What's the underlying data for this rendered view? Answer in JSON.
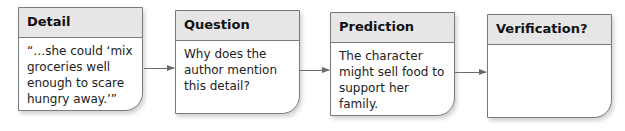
{
  "diagram": {
    "boxes": [
      {
        "title": "Detail",
        "body": "“…she could ‘mix\ngroceries well\nenough to scare\nhungry away.’”"
      },
      {
        "title": "Question",
        "body": "Why does the\nauthor mention\nthis detail?"
      },
      {
        "title": "Prediction",
        "body": "The character\nmight sell food to\nsupport her family."
      },
      {
        "title": "Verification?",
        "body": ""
      }
    ],
    "colors": {
      "header_fill": "#e6e6e6",
      "border": "#7a7a7a",
      "arrow": "#6a6a6a"
    }
  }
}
